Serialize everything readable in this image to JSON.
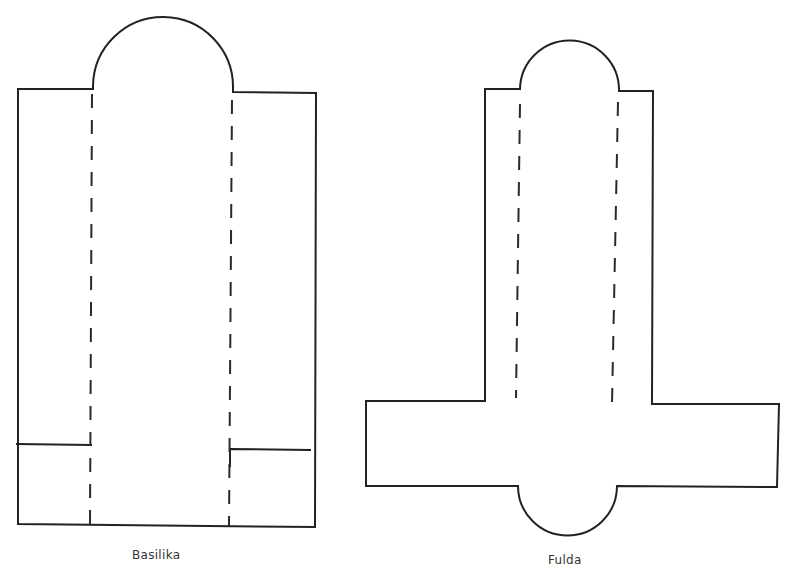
{
  "figures": [
    {
      "id": "basilika",
      "caption": "Basilika",
      "parts": [
        "apse",
        "nave",
        "left-aisle",
        "right-aisle",
        "column-rows"
      ]
    },
    {
      "id": "fulda",
      "caption": "Fulda",
      "parts": [
        "east-apse",
        "nave",
        "transept",
        "west-apse",
        "column-rows"
      ]
    }
  ],
  "colors": {
    "line": "#222222",
    "background": "#ffffff",
    "caption": "#333333"
  }
}
